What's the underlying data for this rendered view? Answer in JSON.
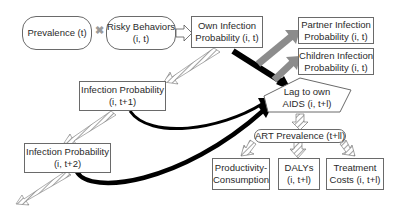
{
  "diagram": {
    "nodes": {
      "prevalence": {
        "line1": "Prevalence (t)"
      },
      "risky": {
        "line1": "Risky Behaviors",
        "line2": "(i, t)"
      },
      "own_infection": {
        "line1": "Own Infection",
        "line2": "Probability (i, t)"
      },
      "partner_infection": {
        "line1": "Partner Infection",
        "line2": "Probability (i, t)"
      },
      "children_infection": {
        "line1": "Children Infection",
        "line2": "Probability (i, t)"
      },
      "infection_t1": {
        "line1": "Infection Probability",
        "line2": "(i, t+1)"
      },
      "lag_aids": {
        "line1": "Lag to own",
        "line2": "AIDS (i, t+l)"
      },
      "infection_t2": {
        "line1": "Infection Probability",
        "line2": "(i, t+2)"
      },
      "art_prevalence": {
        "line1": "ART Prevalence (t+ll)"
      },
      "productivity": {
        "line1": "Productivity-",
        "line2": "Consumption"
      },
      "dalys": {
        "line1": "DALYs",
        "line2": "(i, t+l)"
      },
      "treatment": {
        "line1": "Treatment",
        "line2": "Costs (i, t+l)"
      }
    },
    "operators": {
      "multiply": "✖"
    },
    "colors": {
      "border": "#6a6a6a",
      "thick_arrow": "#000000",
      "gray_arrow": "#8c8c8c",
      "hatched_arrow": "#bdbdbd",
      "text": "#2a2a2a"
    }
  }
}
